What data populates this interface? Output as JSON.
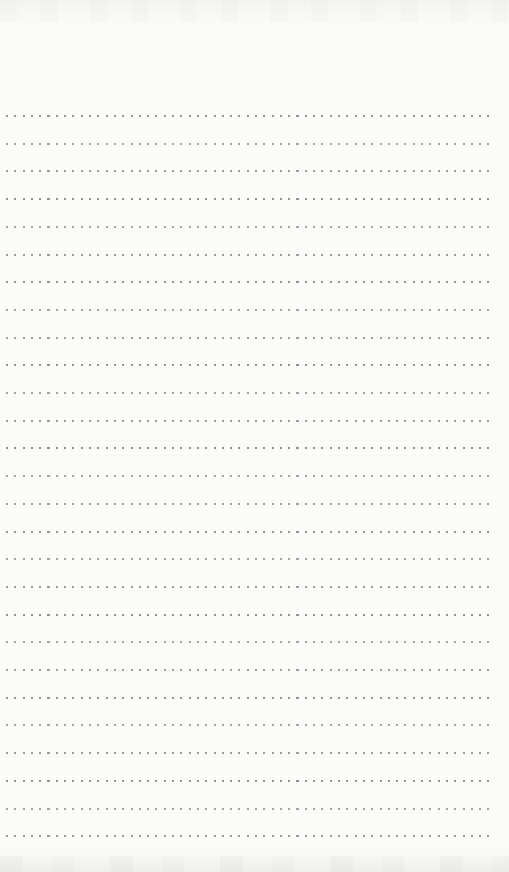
{
  "page": {
    "kind": "blank-dotted-notepad-page",
    "paper_color": "#fbfbfa",
    "dot_color": "#8e8e8e",
    "line_count": 27,
    "first_line_top_px": 115,
    "line_spacing_px": 27.7,
    "line_left_px": 6,
    "line_right_px": 17,
    "dot_size_px": 2,
    "dot_pitch_px": 8.3,
    "dots_per_line_approx": 59,
    "text_content": ""
  }
}
